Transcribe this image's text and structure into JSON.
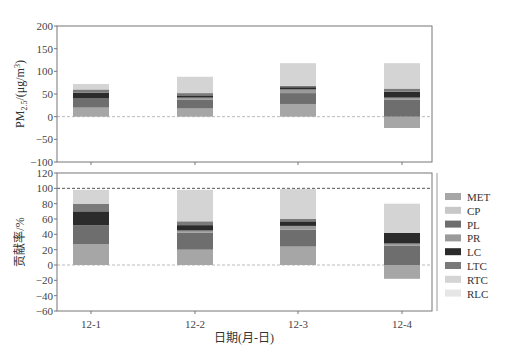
{
  "chart_data": [
    {
      "type": "bar",
      "stacked": true,
      "panel": "top",
      "title": "",
      "ylabel": "PM2.5/(μg/m³)",
      "ylabel_parts": {
        "base": "PM",
        "sub": "2.5",
        "rest": "/(μg/m",
        "sup": "3",
        "close": ")"
      },
      "xlabel": "",
      "ylim": [
        -100,
        200
      ],
      "yticks": [
        -100,
        -50,
        0,
        50,
        100,
        150,
        200
      ],
      "reference_lines": [
        {
          "y": 0,
          "style": "dashed",
          "color": "#bbbbbb"
        }
      ],
      "categories": [
        "12-1",
        "12-2",
        "12-3",
        "12-4"
      ],
      "series": [
        {
          "name": "MET",
          "values": [
            20,
            18,
            28,
            -25
          ]
        },
        {
          "name": "CP",
          "values": [
            0,
            0,
            0,
            0
          ]
        },
        {
          "name": "PL",
          "values": [
            20,
            20,
            24,
            38
          ]
        },
        {
          "name": "PR",
          "values": [
            0,
            4,
            8,
            4
          ]
        },
        {
          "name": "LC",
          "values": [
            13,
            5,
            5,
            13
          ]
        },
        {
          "name": "LTC",
          "values": [
            7,
            5,
            3,
            7
          ]
        },
        {
          "name": "RTC",
          "values": [
            12,
            36,
            50,
            56
          ]
        },
        {
          "name": "RLC",
          "values": [
            0,
            0,
            0,
            0
          ]
        }
      ]
    },
    {
      "type": "bar",
      "stacked": true,
      "panel": "bottom",
      "title": "",
      "ylabel": "贡献率/%",
      "xlabel": "日期(月-日)",
      "ylim": [
        -60,
        120
      ],
      "yticks": [
        -60,
        -40,
        -20,
        0,
        20,
        40,
        60,
        80,
        100,
        120
      ],
      "reference_lines": [
        {
          "y": 0,
          "style": "dashed",
          "color": "#bbbbbb"
        },
        {
          "y": 100,
          "style": "dashed",
          "color": "#555555"
        }
      ],
      "categories": [
        "12-1",
        "12-2",
        "12-3",
        "12-4"
      ],
      "series": [
        {
          "name": "MET",
          "values": [
            27,
            20,
            24,
            -18
          ]
        },
        {
          "name": "CP",
          "values": [
            0,
            0,
            0,
            0
          ]
        },
        {
          "name": "PL",
          "values": [
            25,
            22,
            22,
            25
          ]
        },
        {
          "name": "PR",
          "values": [
            0,
            3,
            5,
            3
          ]
        },
        {
          "name": "LC",
          "values": [
            18,
            7,
            6,
            14
          ]
        },
        {
          "name": "LTC",
          "values": [
            10,
            5,
            3,
            0
          ]
        },
        {
          "name": "RTC",
          "values": [
            18,
            41,
            39,
            38
          ]
        },
        {
          "name": "RLC",
          "values": [
            0,
            0,
            0,
            0
          ]
        }
      ]
    }
  ],
  "legend": {
    "position": "right",
    "items": [
      {
        "name": "MET",
        "color": "#a6a6a6"
      },
      {
        "name": "CP",
        "color": "#c8c8c8"
      },
      {
        "name": "PL",
        "color": "#6e6e6e"
      },
      {
        "name": "PR",
        "color": "#9a9a9a"
      },
      {
        "name": "LC",
        "color": "#2b2b2b"
      },
      {
        "name": "LTC",
        "color": "#7a7a7a"
      },
      {
        "name": "RTC",
        "color": "#d4d4d4"
      },
      {
        "name": "RLC",
        "color": "#e6e6e6"
      }
    ]
  }
}
